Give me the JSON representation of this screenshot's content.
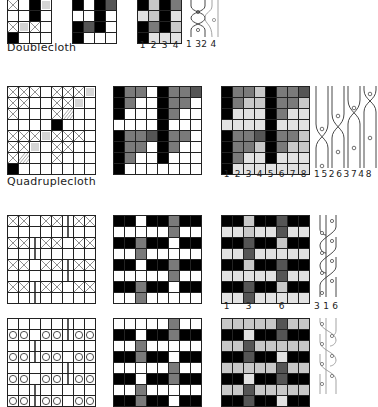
{
  "sections": [
    {
      "title": "Doublecloth",
      "cols": 4,
      "rows": 4,
      "draft": [
        [
          "x",
          "",
          "k",
          "h"
        ],
        [
          "",
          "",
          "k",
          ""
        ],
        [
          "x",
          "h",
          "x",
          ""
        ],
        [
          "k",
          "",
          "",
          ""
        ]
      ],
      "drawdown": [
        [
          "k",
          "",
          "k",
          "dg"
        ],
        [
          "",
          "",
          "k",
          ""
        ],
        [
          "k",
          "dg",
          "k",
          ""
        ],
        [
          "k",
          "",
          "",
          ""
        ]
      ],
      "shaded": [
        [
          "k",
          "lg",
          "k",
          "mg"
        ],
        [
          "vlg",
          "lg",
          "k",
          "vlg"
        ],
        [
          "k",
          "mg",
          "k",
          "lg"
        ],
        [
          "k",
          "vlg",
          "vlg",
          "vlg"
        ]
      ],
      "shaded_numbers": [
        "1",
        "2",
        "3",
        "4"
      ],
      "strand_numbers": "1 32 4"
    },
    {
      "title": "Quadruplecloth",
      "cols": 8,
      "rows": 8,
      "draft": [
        [
          "x",
          "x",
          "x",
          "",
          "x",
          "x",
          "x",
          "v"
        ],
        [
          "x",
          "x",
          "",
          "",
          "x",
          "x",
          "h",
          ""
        ],
        [
          "x",
          "",
          "",
          "",
          "x",
          "d",
          "",
          ""
        ],
        [
          "",
          "",
          "",
          "",
          "k",
          "",
          "",
          ""
        ],
        [
          "x",
          "x",
          "x",
          "v",
          "x",
          "x",
          "x",
          ""
        ],
        [
          "x",
          "x",
          "h",
          "",
          "x",
          "x",
          "",
          ""
        ],
        [
          "x",
          "d",
          "",
          "",
          "x",
          "",
          "",
          ""
        ],
        [
          "k",
          "",
          "",
          "",
          "",
          "",
          "",
          ""
        ]
      ],
      "drawdown": [
        [
          "k",
          "mg",
          "mg",
          "",
          "k",
          "mg",
          "mg",
          "dg"
        ],
        [
          "k",
          "mg",
          "",
          "",
          "k",
          "mg",
          "mg",
          ""
        ],
        [
          "k",
          "",
          "",
          "",
          "k",
          "mg",
          "",
          ""
        ],
        [
          "",
          "",
          "",
          "",
          "k",
          "",
          "",
          ""
        ],
        [
          "k",
          "mg",
          "mg",
          "dg",
          "k",
          "mg",
          "mg",
          ""
        ],
        [
          "k",
          "mg",
          "mg",
          "",
          "k",
          "mg",
          "",
          ""
        ],
        [
          "k",
          "mg",
          "",
          "",
          "k",
          "",
          "",
          ""
        ],
        [
          "k",
          "",
          "",
          "",
          "",
          "",
          "",
          ""
        ]
      ],
      "shaded": [
        [
          "k",
          "mg",
          "mg",
          "lg",
          "k",
          "mg",
          "mg",
          "dg"
        ],
        [
          "k",
          "mg",
          "lg",
          "lg",
          "k",
          "mg",
          "mg",
          "lg"
        ],
        [
          "k",
          "vlg",
          "vlg",
          "vlg",
          "k",
          "mg",
          "vlg",
          "vlg"
        ],
        [
          "vlg",
          "vlg",
          "vlg",
          "vlg",
          "k",
          "vlg",
          "vlg",
          "vlg"
        ],
        [
          "k",
          "mg",
          "mg",
          "dg",
          "k",
          "mg",
          "mg",
          "lg"
        ],
        [
          "k",
          "mg",
          "mg",
          "lg",
          "k",
          "mg",
          "lg",
          "lg"
        ],
        [
          "k",
          "mg",
          "vlg",
          "vlg",
          "k",
          "vlg",
          "vlg",
          "vlg"
        ],
        [
          "k",
          "vlg",
          "vlg",
          "vlg",
          "vlg",
          "vlg",
          "vlg",
          "vlg"
        ]
      ],
      "shaded_numbers": [
        "1",
        "2",
        "3",
        "4",
        "5",
        "6",
        "7",
        "8"
      ],
      "strand_numbers": "1 5 2 6 3 7 4 8"
    },
    {
      "title": "",
      "cols": 8,
      "rows": 8,
      "draft": [
        [
          "x",
          "x",
          "",
          "x",
          "x",
          "|",
          "x",
          "x"
        ],
        [
          "",
          "",
          "",
          "",
          "",
          "|",
          "",
          ""
        ],
        [
          "x",
          "x",
          "|",
          "x",
          "x",
          "",
          "x",
          "x"
        ],
        [
          "",
          "",
          "|",
          "",
          "",
          "",
          "",
          ""
        ],
        [
          "x",
          "x",
          "",
          "x",
          "x",
          "|",
          "x",
          "x"
        ],
        [
          "",
          "",
          "",
          "",
          "",
          "|",
          "",
          ""
        ],
        [
          "x",
          "x",
          "|",
          "x",
          "x",
          "",
          "x",
          "x"
        ],
        [
          "",
          "",
          "|",
          "",
          "",
          "",
          "",
          ""
        ]
      ],
      "drawdown": [
        [
          "k",
          "k",
          "",
          "k",
          "k",
          "mg",
          "k",
          "k"
        ],
        [
          "",
          "",
          "",
          "",
          "",
          "mg",
          "",
          ""
        ],
        [
          "k",
          "k",
          "mg",
          "k",
          "k",
          "",
          "k",
          "k"
        ],
        [
          "",
          "",
          "mg",
          "",
          "",
          "",
          "",
          ""
        ],
        [
          "k",
          "k",
          "",
          "k",
          "k",
          "mg",
          "k",
          "k"
        ],
        [
          "",
          "",
          "",
          "",
          "",
          "mg",
          "",
          ""
        ],
        [
          "k",
          "k",
          "mg",
          "k",
          "k",
          "",
          "k",
          "k"
        ],
        [
          "",
          "",
          "mg",
          "",
          "",
          "",
          "",
          ""
        ]
      ],
      "shaded": [
        [
          "k",
          "k",
          "lg",
          "k",
          "k",
          "dg",
          "k",
          "k"
        ],
        [
          "vlg",
          "vlg",
          "lg",
          "vlg",
          "vlg",
          "dg",
          "vlg",
          "vlg"
        ],
        [
          "k",
          "k",
          "dg",
          "k",
          "k",
          "lg",
          "k",
          "k"
        ],
        [
          "vlg",
          "vlg",
          "dg",
          "vlg",
          "vlg",
          "vlg",
          "vlg",
          "vlg"
        ],
        [
          "k",
          "k",
          "lg",
          "k",
          "k",
          "dg",
          "k",
          "k"
        ],
        [
          "vlg",
          "vlg",
          "vlg",
          "vlg",
          "vlg",
          "dg",
          "vlg",
          "vlg"
        ],
        [
          "k",
          "k",
          "dg",
          "k",
          "k",
          "lg",
          "k",
          "k"
        ],
        [
          "vlg",
          "vlg",
          "dg",
          "vlg",
          "vlg",
          "vlg",
          "vlg",
          "vlg"
        ]
      ],
      "shaded_numbers": [
        "1",
        "",
        "3",
        "",
        "",
        "6",
        "",
        ""
      ],
      "strand_numbers": "3 1 6"
    },
    {
      "title": "",
      "cols": 8,
      "rows": 8,
      "draft": [
        [
          "",
          "",
          "",
          "",
          "",
          "|",
          "",
          ""
        ],
        [
          "o",
          "o",
          "",
          "o",
          "o",
          "|",
          "o",
          "o"
        ],
        [
          "",
          "",
          "|",
          "",
          "",
          "",
          "",
          ""
        ],
        [
          "o",
          "o",
          "|",
          "o",
          "o",
          "",
          "o",
          "o"
        ],
        [
          "",
          "",
          "",
          "",
          "",
          "|",
          "",
          ""
        ],
        [
          "o",
          "o",
          "",
          "o",
          "o",
          "|",
          "o",
          "o"
        ],
        [
          "",
          "",
          "|",
          "",
          "",
          "",
          "",
          ""
        ],
        [
          "o",
          "o",
          "|",
          "o",
          "o",
          "",
          "o",
          "o"
        ]
      ],
      "drawdown": [
        [
          "",
          "",
          "",
          "",
          "",
          "mg",
          "",
          ""
        ],
        [
          "k",
          "k",
          "",
          "k",
          "k",
          "mg",
          "k",
          "k"
        ],
        [
          "",
          "",
          "mg",
          "",
          "",
          "",
          "",
          ""
        ],
        [
          "k",
          "k",
          "mg",
          "k",
          "k",
          "",
          "k",
          "k"
        ],
        [
          "",
          "",
          "",
          "",
          "",
          "mg",
          "",
          ""
        ],
        [
          "k",
          "k",
          "",
          "k",
          "k",
          "mg",
          "k",
          "k"
        ],
        [
          "",
          "",
          "mg",
          "",
          "",
          "",
          "",
          ""
        ],
        [
          "k",
          "k",
          "mg",
          "k",
          "k",
          "",
          "k",
          "k"
        ]
      ],
      "shaded": [
        [
          "lg",
          "lg",
          "lg",
          "lg",
          "lg",
          "dg",
          "lg",
          "lg"
        ],
        [
          "k",
          "k",
          "vlg",
          "k",
          "k",
          "dg",
          "k",
          "k"
        ],
        [
          "lg",
          "lg",
          "dg",
          "lg",
          "lg",
          "lg",
          "lg",
          "lg"
        ],
        [
          "k",
          "k",
          "dg",
          "k",
          "k",
          "vlg",
          "k",
          "k"
        ],
        [
          "lg",
          "lg",
          "lg",
          "lg",
          "lg",
          "dg",
          "lg",
          "lg"
        ],
        [
          "k",
          "k",
          "vlg",
          "k",
          "k",
          "dg",
          "k",
          "k"
        ],
        [
          "lg",
          "lg",
          "dg",
          "lg",
          "lg",
          "lg",
          "lg",
          "lg"
        ],
        [
          "k",
          "k",
          "dg",
          "k",
          "k",
          "vlg",
          "k",
          "k"
        ]
      ],
      "shaded_numbers": [],
      "strand_numbers": ""
    }
  ],
  "colors": {
    "k": "#000000",
    "dg": "#555555",
    "mg": "#7a7a7a",
    "lg": "#c8c8c8",
    "vlg": "#e2e2e2",
    "grid_line": "#222222"
  }
}
